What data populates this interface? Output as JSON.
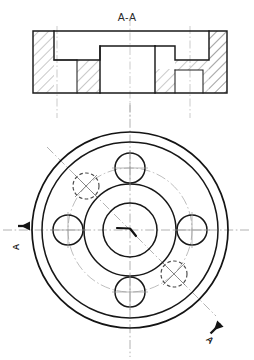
{
  "document": {
    "type": "engineering-drawing",
    "background_color": "#ffffff",
    "line_color": "#1a1a1a",
    "hatch_color": "#6f6f6f",
    "centerline_color": "#9a9a9a",
    "hidden_line_color": "#4a4a4a"
  },
  "section_view": {
    "title": "A-A",
    "description": "sectional elevation",
    "hatching": "45-degree section hatch",
    "bounds": {
      "left": 33,
      "top": 31,
      "right": 227,
      "bottom": 93
    }
  },
  "plan_view": {
    "description": "circular flange plan view",
    "center": {
      "x": 130,
      "y": 230
    },
    "circles": [
      {
        "name": "outer-rim-outer",
        "r": 98
      },
      {
        "name": "outer-rim-inner",
        "r": 88
      },
      {
        "name": "hub-outer",
        "r": 46
      },
      {
        "name": "bore",
        "r": 27
      }
    ],
    "bolt_circle_radius": 62,
    "holes": [
      {
        "name": "hole-top",
        "angle": -90,
        "r": 15,
        "hidden": false
      },
      {
        "name": "hole-right",
        "angle": 0,
        "r": 15,
        "hidden": false
      },
      {
        "name": "hole-bottom",
        "angle": 90,
        "r": 15,
        "hidden": false
      },
      {
        "name": "hole-left",
        "angle": 180,
        "r": 15,
        "hidden": false
      },
      {
        "name": "hole-upper-left",
        "angle": -135,
        "r": 13,
        "hidden": true
      },
      {
        "name": "hole-lower-right",
        "angle": 45,
        "r": 13,
        "hidden": true
      }
    ]
  },
  "section_markers": {
    "left": {
      "label": "A",
      "orientation": "vertical-rotated",
      "arrow": "right"
    },
    "bottom_right": {
      "label": "A",
      "orientation": "diagonal-rotated",
      "arrow": "up-right"
    }
  },
  "labels": {
    "title": "A-A",
    "marker_left": "A",
    "marker_bottom_right": "A"
  }
}
